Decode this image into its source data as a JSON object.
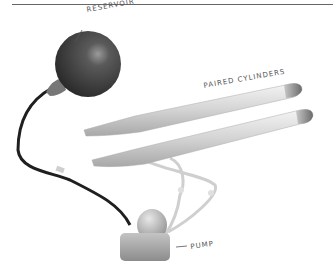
{
  "figure": {
    "labels": {
      "reservoir": "RESERVOIR",
      "cylinders": "PAIRED CYLINDERS",
      "pump": "PUMP"
    },
    "components": [
      {
        "name": "reservoir",
        "shape": "sphere",
        "color": "#4a4a4a"
      },
      {
        "name": "paired-cylinders",
        "shape": "two elongated tubes",
        "color": "#d8d8d8"
      },
      {
        "name": "pump",
        "shape": "rounded bulb on rectangular base",
        "color": "#b0b0b0"
      },
      {
        "name": "tubing",
        "color": "#1f1f1f"
      }
    ]
  }
}
